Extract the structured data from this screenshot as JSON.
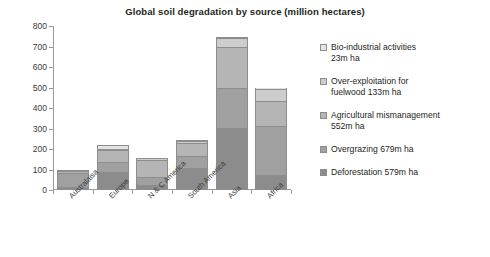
{
  "chart_data": {
    "type": "bar",
    "subtype": "stacked-vertical",
    "title": "Global soil degradation by source (million hectares)",
    "xlabel": "",
    "ylabel": "",
    "ylim": [
      0,
      800
    ],
    "ytick_step": 100,
    "yticks": [
      "0",
      "100",
      "200",
      "300",
      "400",
      "500",
      "600",
      "700",
      "800"
    ],
    "grid": false,
    "legend_position": "right",
    "categories": [
      "Australaisa",
      "Europe",
      "N & C America",
      "South America",
      "Asia",
      "Africa"
    ],
    "series": [
      {
        "name": "Deforestation",
        "legend_label": "Deforestation 579m ha",
        "total": "579m ha",
        "color": "#8c8c8c",
        "values": [
          4,
          84,
          18,
          100,
          298,
          67
        ]
      },
      {
        "name": "Overgrazing",
        "legend_label": "Overgrazing 679m ha",
        "total": "679m ha",
        "color": "#a0a0a0",
        "values": [
          83,
          50,
          38,
          64,
          197,
          243
        ]
      },
      {
        "name": "Agricultural mismanagement",
        "legend_label": "Agricultural mismanagement 552m ha",
        "total": "552m ha",
        "color": "#b5b5b5",
        "values": [
          8,
          64,
          91,
          64,
          204,
          121
        ]
      },
      {
        "name": "Over-exploitation for fuelwood",
        "legend_label": "Over-exploitation for fuelwood 133m ha",
        "total": "133m ha",
        "color": "#cdcdcd",
        "values": [
          0,
          1,
          11,
          12,
          46,
          63
        ]
      },
      {
        "name": "Bio-industrial activities",
        "legend_label": "Bio-industrial activities 23m ha",
        "total": "23m ha",
        "color": "#e3e3e3",
        "values": [
          1,
          22,
          0,
          5,
          1,
          6
        ]
      }
    ],
    "totals": [
      96,
      221,
      158,
      245,
      746,
      500
    ]
  },
  "legend": {
    "items": [
      {
        "label_line1": "Bio-industrial activities",
        "label_line2": "23m ha",
        "color": "#e3e3e3"
      },
      {
        "label_line1": "Over-exploitation for",
        "label_line2": "fuelwood 133m ha",
        "color": "#cdcdcd"
      },
      {
        "label_line1": "Agricultural mismanagement",
        "label_line2": "552m ha",
        "color": "#b5b5b5"
      },
      {
        "label_line1": "Overgrazing 679m ha",
        "label_line2": "",
        "color": "#a0a0a0"
      },
      {
        "label_line1": "Deforestation 579m ha",
        "label_line2": "",
        "color": "#8c8c8c"
      }
    ]
  },
  "colors": {
    "axis": "#9a9a9a",
    "text": "#231f20",
    "background": "#ffffff"
  }
}
